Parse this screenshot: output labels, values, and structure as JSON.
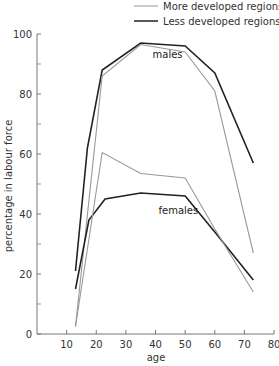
{
  "chart_data": {
    "type": "line",
    "title": "",
    "xlabel": "age",
    "ylabel": "percentage in labour force",
    "xlim": [
      0,
      80
    ],
    "ylim": [
      0,
      100
    ],
    "x_ticks": [
      10,
      20,
      30,
      40,
      50,
      60,
      70,
      80
    ],
    "y_ticks_labeled": [
      0,
      20,
      40,
      60,
      80,
      100
    ],
    "y_ticks_minor": [
      10,
      30,
      50,
      70,
      90
    ],
    "grid": false,
    "legend": {
      "position": "top-right",
      "entries": [
        {
          "label": "More developed regions",
          "color": "#999999"
        },
        {
          "label": "Less developed regions",
          "color": "#222222"
        }
      ]
    },
    "annotations": [
      {
        "text": "males",
        "x": 39,
        "y": 92
      },
      {
        "text": "females",
        "x": 41,
        "y": 40
      }
    ],
    "series": [
      {
        "name": "Males – Less developed regions",
        "group": "males",
        "region": "Less developed regions",
        "color": "#222222",
        "x": [
          13,
          17,
          22,
          35,
          50,
          60,
          73
        ],
        "values": [
          21,
          62,
          88,
          97,
          96,
          87,
          57
        ]
      },
      {
        "name": "Males – More developed regions",
        "group": "males",
        "region": "More developed regions",
        "color": "#999999",
        "x": [
          13,
          22,
          35,
          50,
          60,
          73
        ],
        "values": [
          2.5,
          86,
          96.5,
          94,
          81,
          27
        ]
      },
      {
        "name": "Females – Less developed regions",
        "group": "females",
        "region": "Less developed regions",
        "color": "#222222",
        "x": [
          13,
          17.5,
          23,
          35,
          50,
          60,
          73
        ],
        "values": [
          15,
          38,
          45,
          47,
          46,
          34,
          18
        ]
      },
      {
        "name": "Females – More developed regions",
        "group": "females",
        "region": "More developed regions",
        "color": "#999999",
        "x": [
          13,
          22,
          35,
          50,
          60,
          73
        ],
        "values": [
          2.5,
          60.5,
          53.5,
          52,
          35,
          14
        ]
      }
    ]
  },
  "legend": {
    "more_developed": "More developed regions",
    "less_developed": "Less developed regions"
  },
  "labels": {
    "males": "males",
    "females": "females",
    "xlabel": "age",
    "ylabel": "percentage in labour force"
  }
}
